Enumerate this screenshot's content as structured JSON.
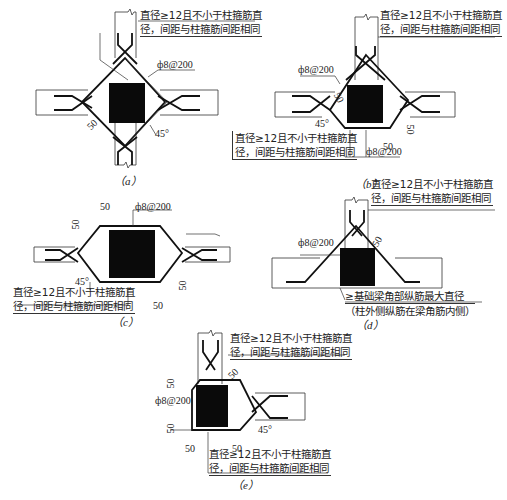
{
  "diagrams": [
    {
      "id": "a",
      "caption": "（a）",
      "note_top": [
        "直径≥12且不小于柱箍筋直",
        "径，间距与柱箍筋间距相同"
      ],
      "stirrup": "ф8@200",
      "dim_50": "50",
      "angle": "45°"
    },
    {
      "id": "b",
      "caption": "（b）",
      "note_top": [
        "直径≥12且不小于柱箍筋直",
        "径，间距与柱箍筋间距相同"
      ],
      "stirrup_left": "ф8@200",
      "stirrup_bottom": "ф8@200",
      "note_bottom": [
        "直径≥12且不小于柱箍筋直",
        "径，间距与柱箍筋间距相同"
      ],
      "dim_50_a": "50",
      "dim_50_b": "50",
      "dim_50_c": "50",
      "angle": "45°"
    },
    {
      "id": "c",
      "caption": "（c）",
      "stirrup": "ф8@200",
      "note_bottom": [
        "直径≥12且不小于柱箍筋直",
        "径，间距与柱箍筋间距相同"
      ],
      "dim_50_top_h": "50",
      "dim_50_top_v": "50",
      "dim_50_bot_v": "50",
      "dim_50_bot_h": "50",
      "angle": "45°"
    },
    {
      "id": "d",
      "caption": "（d）",
      "note_top": [
        "直径≥12且不小于柱箍筋直",
        "径，间距与柱箍筋间距相同"
      ],
      "stirrup": "ф8@200",
      "dim_50": "50",
      "note_bottom": [
        "≥基础梁角部纵筋最大直径",
        "（柱外侧纵筋在梁角筋内侧）"
      ]
    },
    {
      "id": "e",
      "caption": "（e）",
      "note_top": [
        "直径≥12且不小于柱箍筋直",
        "径，间距与柱箍筋间距相同"
      ],
      "stirrup": "ф8@200",
      "note_bottom": [
        "直径≥12且不小于柱箍筋直",
        "径，间距与柱箍筋间距相同"
      ],
      "dim_50_diag": "50",
      "dim_50_top_v": "50",
      "dim_50_bot_v": "50",
      "dim_50_bot_h1": "50",
      "dim_50_bot_h2": "50",
      "angle": "45°"
    }
  ]
}
